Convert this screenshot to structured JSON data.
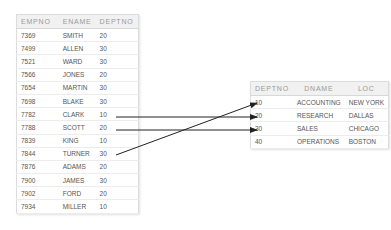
{
  "emp_table": {
    "headers": [
      "EMPNO",
      "ENAME",
      "DEPTNO"
    ],
    "rows": [
      [
        "7369",
        "SMITH",
        "20"
      ],
      [
        "7499",
        "ALLEN",
        "30"
      ],
      [
        "7521",
        "WARD",
        "30"
      ],
      [
        "7566",
        "JONES",
        "20"
      ],
      [
        "7654",
        "MARTIN",
        "30"
      ],
      [
        "7698",
        "BLAKE",
        "30"
      ],
      [
        "7782",
        "CLARK",
        "10"
      ],
      [
        "7788",
        "SCOTT",
        "20"
      ],
      [
        "7839",
        "KING",
        "10"
      ],
      [
        "7844",
        "TURNER",
        "30"
      ],
      [
        "7876",
        "ADAMS",
        "20"
      ],
      [
        "7900",
        "JAMES",
        "30"
      ],
      [
        "7902",
        "FORD",
        "20"
      ],
      [
        "7934",
        "MILLER",
        "10"
      ]
    ]
  },
  "dept_table": {
    "headers": [
      "DEPTNO",
      "DNAME",
      "LOC"
    ],
    "rows": [
      [
        "10",
        "ACCOUNTING",
        "NEW YORK"
      ],
      [
        "20",
        "RESEARCH",
        "DALLAS"
      ],
      [
        "30",
        "SALES",
        "CHICAGO"
      ],
      [
        "40",
        "OPERATIONS",
        "BOSTON"
      ]
    ]
  },
  "arrows": [
    {
      "from": "CLARK",
      "to": "20"
    },
    {
      "from": "SCOTT",
      "to": "30"
    },
    {
      "from": "TURNER",
      "to": "10"
    }
  ],
  "colors": {
    "arrow": "#222222",
    "header_bg": "#f1f1f1",
    "border": "#dcdcdc"
  }
}
